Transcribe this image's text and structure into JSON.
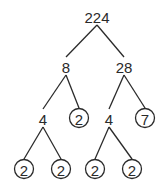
{
  "diagram": {
    "type": "factor-tree",
    "nodes": [
      {
        "id": "n224",
        "label": "224",
        "prime": false
      },
      {
        "id": "n8",
        "label": "8",
        "prime": false
      },
      {
        "id": "n28",
        "label": "28",
        "prime": false
      },
      {
        "id": "n4a",
        "label": "4",
        "prime": false
      },
      {
        "id": "n2a",
        "label": "2",
        "prime": true
      },
      {
        "id": "n4b",
        "label": "4",
        "prime": false
      },
      {
        "id": "n7",
        "label": "7",
        "prime": true
      },
      {
        "id": "n2b",
        "label": "2",
        "prime": true
      },
      {
        "id": "n2c",
        "label": "2",
        "prime": true
      },
      {
        "id": "n2d",
        "label": "2",
        "prime": true
      },
      {
        "id": "n2e",
        "label": "2",
        "prime": true
      }
    ],
    "edges": [
      [
        "n224",
        "n8"
      ],
      [
        "n224",
        "n28"
      ],
      [
        "n8",
        "n4a"
      ],
      [
        "n8",
        "n2a"
      ],
      [
        "n28",
        "n4b"
      ],
      [
        "n28",
        "n7"
      ],
      [
        "n4a",
        "n2b"
      ],
      [
        "n4a",
        "n2c"
      ],
      [
        "n4b",
        "n2d"
      ],
      [
        "n4b",
        "n2e"
      ]
    ]
  }
}
